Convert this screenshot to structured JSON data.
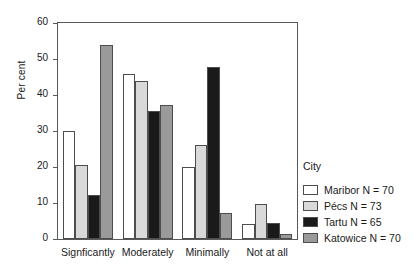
{
  "chart_data": {
    "type": "bar",
    "title": "",
    "xlabel": "",
    "ylabel": "Per cent",
    "ylim": [
      0,
      60
    ],
    "yticks": [
      0,
      10,
      20,
      30,
      40,
      50,
      60
    ],
    "ytick_labels": [
      "0",
      "10",
      "20",
      "30",
      "40",
      "50",
      "60"
    ],
    "grid": false,
    "legend_position": "right",
    "legend_title": "City",
    "categories": [
      "Signficantly",
      "Moderately",
      "Minimally",
      "Not at all"
    ],
    "series": [
      {
        "name": "Maribor N = 70",
        "city": "Maribor",
        "n": 70,
        "color": "#ffffff",
        "values": [
          30.0,
          45.8,
          20.0,
          4.3
        ]
      },
      {
        "name": "Pécs N = 73",
        "city": "Pécs",
        "n": 73,
        "color": "#d9d9d9",
        "values": [
          20.5,
          43.8,
          26.2,
          9.8
        ]
      },
      {
        "name": "Tartu N = 65",
        "city": "Tartu",
        "n": 65,
        "color": "#1a1a1a",
        "values": [
          12.3,
          35.5,
          47.7,
          4.5
        ]
      },
      {
        "name": "Katowice N = 70",
        "city": "Katowice",
        "n": 70,
        "color": "#9a9a9a",
        "values": [
          54.0,
          37.2,
          7.2,
          1.5
        ]
      }
    ]
  },
  "axis": {
    "y_title": "Per cent"
  },
  "legend": {
    "title": "City",
    "items": [
      {
        "label": "Maribor N = 70",
        "color": "#ffffff"
      },
      {
        "label": "Pécs N = 73",
        "color": "#d9d9d9"
      },
      {
        "label": "Tartu N = 65",
        "color": "#1a1a1a"
      },
      {
        "label": "Katowice N = 70",
        "color": "#9a9a9a"
      }
    ]
  },
  "colors": {
    "axis": "#58595b",
    "bar_outline": "#4d4d4d",
    "text": "#1a1a1a",
    "background": "#ffffff"
  }
}
